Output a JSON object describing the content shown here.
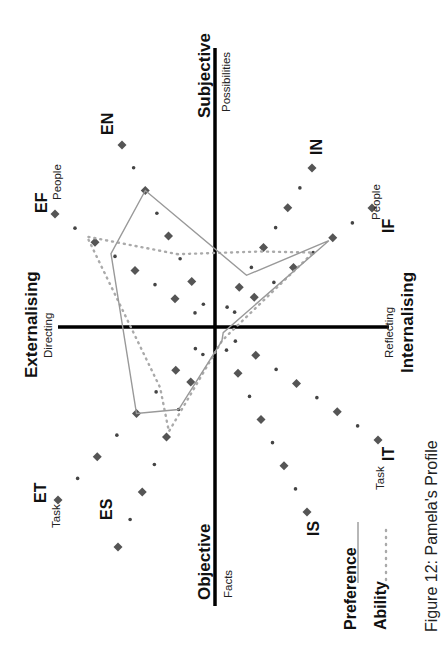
{
  "figure": {
    "caption": "Figure 12: Pamela's Profile",
    "axes": {
      "top": {
        "title": "Subjective",
        "subtitle": "Possibilities"
      },
      "bottom": {
        "title": "Objective",
        "subtitle": "Facts"
      },
      "left": {
        "title": "Externalising",
        "subtitle": "Directing"
      },
      "right": {
        "title": "Internalising",
        "subtitle": "Reflecting"
      }
    },
    "spokes": [
      {
        "code": "EN",
        "sub": ""
      },
      {
        "code": "EF",
        "sub": "People"
      },
      {
        "code": "ET",
        "sub": "Task"
      },
      {
        "code": "ES",
        "sub": ""
      },
      {
        "code": "IS",
        "sub": ""
      },
      {
        "code": "IT",
        "sub": "Task"
      },
      {
        "code": "IF",
        "sub": "People"
      },
      {
        "code": "IN",
        "sub": ""
      }
    ],
    "legend": {
      "preference": "Preference",
      "ability": "Ability"
    }
  },
  "chart_data": {
    "type": "radar",
    "title": "Figure 12: Pamela's Profile",
    "orientation": "rotated 90° clockwise (page printed sideways)",
    "axes": [
      "EN",
      "EF",
      "ET",
      "ES",
      "IS",
      "IT",
      "IF",
      "IN"
    ],
    "scale": [
      0,
      4
    ],
    "series": [
      {
        "name": "Preference",
        "style": "solid grey line",
        "values": {
          "EN": 3,
          "EF": 2.6,
          "ET": 2,
          "ES": 1.5,
          "IS": 0.3,
          "IT": 0.2,
          "IF": 2.9,
          "IN": 1.3
        }
      },
      {
        "name": "Ability",
        "style": "dotted grey line",
        "values": {
          "EN": 1.6,
          "EF": 3.2,
          "ET": 1.4,
          "ES": 1.9,
          "IS": 0.3,
          "IT": 0.3,
          "IF": 2.5,
          "IN": 1.9
        }
      }
    ],
    "quadrant_axes": {
      "vertical": [
        "Subjective / Possibilities",
        "Objective / Facts"
      ],
      "horizontal": [
        "Externalising / Directing",
        "Internalising / Reflecting"
      ]
    },
    "legend_position": "bottom"
  }
}
